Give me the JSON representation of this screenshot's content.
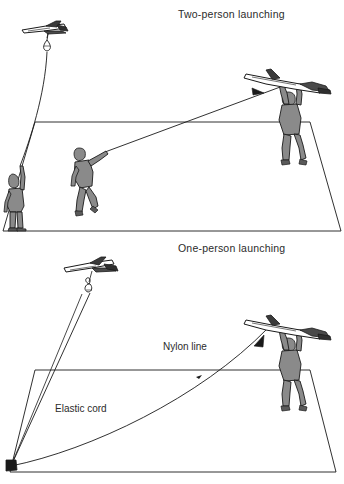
{
  "figure": {
    "type": "diagram",
    "background_color": "#ffffff",
    "line_color": "#1a1a1a",
    "figure_fill_color": "#8a8a8a",
    "text_color": "#2b2b2b"
  },
  "panels": [
    {
      "id": "two-person",
      "title": "Two-person launching",
      "elements": {
        "glider_label": "glider-icon",
        "streamer_label": "streamer-icon",
        "standing_person": "person-holding-line",
        "running_person": "person-running-pulling-line",
        "launcher_person": "person-holding-glider-overhead",
        "ground_plane": "ground-plane-trapezoid",
        "tow_line": "tow-line-with-arrow"
      }
    },
    {
      "id": "one-person",
      "title": "One-person launching",
      "labels": [
        "Nylon line",
        "Elastic cord"
      ],
      "elements": {
        "glider_label": "glider-icon",
        "hook_label": "tow-hook-icon",
        "launcher_person": "person-holding-glider-overhead",
        "ground_plane": "ground-plane-trapezoid",
        "anchor_stake": "anchor-stake-icon",
        "nylon_line": "nylon-line-with-arrow",
        "elastic_cord": "elastic-cord-line"
      }
    }
  ],
  "annotations": {
    "nylon_line": "Nylon line",
    "elastic_cord": "Elastic cord"
  }
}
